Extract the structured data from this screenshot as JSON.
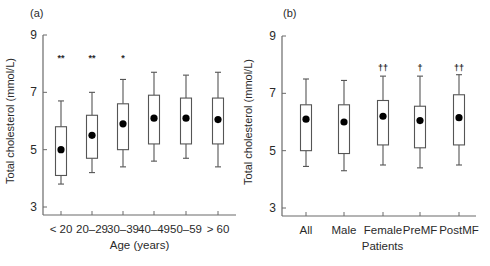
{
  "chart_data": [
    {
      "panel_label": "(a)",
      "type": "box",
      "xlabel": "Age (years)",
      "ylabel": "Total cholesterol (mmol/L)",
      "ylim": [
        3,
        9
      ],
      "yticks": [
        3,
        5,
        7,
        9
      ],
      "grid": false,
      "legend": null,
      "categories": [
        "< 20",
        "20–29",
        "30–39",
        "40–49",
        "50–59",
        "> 60"
      ],
      "whisker_low": [
        3.8,
        4.2,
        4.4,
        4.6,
        4.7,
        4.4
      ],
      "box_low": [
        4.1,
        4.7,
        5.0,
        5.2,
        5.2,
        5.2
      ],
      "box_high": [
        5.8,
        6.2,
        6.6,
        6.9,
        6.8,
        6.8
      ],
      "whisker_high": [
        6.7,
        7.0,
        7.45,
        7.7,
        7.6,
        7.7
      ],
      "mean": [
        5.0,
        5.5,
        5.9,
        6.1,
        6.1,
        6.05
      ],
      "annotations": [
        "**",
        "**",
        "*",
        "",
        "",
        ""
      ],
      "annotation_y": 8.2
    },
    {
      "panel_label": "(b)",
      "type": "box",
      "xlabel": "Patients",
      "ylabel": "Total cholesterol (mmol/L)",
      "ylim": [
        3,
        9
      ],
      "yticks": [
        3,
        5,
        7,
        9
      ],
      "grid": false,
      "legend": null,
      "categories": [
        "All",
        "Male",
        "Female",
        "PreMF",
        "PostMF"
      ],
      "whisker_low": [
        4.45,
        4.3,
        4.5,
        4.4,
        4.5
      ],
      "box_low": [
        5.0,
        4.9,
        5.2,
        5.1,
        5.2
      ],
      "box_high": [
        6.6,
        6.6,
        6.75,
        6.55,
        6.95
      ],
      "whisker_high": [
        7.5,
        7.45,
        7.6,
        7.6,
        7.65
      ],
      "mean": [
        6.1,
        6.0,
        6.2,
        6.05,
        6.15
      ],
      "annotations": [
        "",
        "",
        "††",
        "†",
        "††"
      ],
      "annotation_y": 7.9
    }
  ],
  "layout": {
    "panels": [
      {
        "axis_x": 43,
        "axis_right": 236,
        "y_top_px": 35,
        "y_bottom_px": 207,
        "xaxis_y": 215,
        "cat_x": [
          61,
          92,
          123,
          154,
          186,
          218
        ],
        "box_w": 11,
        "label_x": 30,
        "label_y": 17,
        "ylabel_x": 14,
        "xlabel_y": 249
      },
      {
        "axis_x": 282,
        "axis_right": 476,
        "y_top_px": 36,
        "y_bottom_px": 208,
        "xaxis_y": 216,
        "cat_x": [
          306,
          344,
          383,
          420,
          459
        ],
        "box_w": 11,
        "label_x": 283,
        "label_y": 17,
        "ylabel_x": 252,
        "xlabel_y": 250
      }
    ],
    "colors": {
      "axis": "#6a6a6a",
      "box_stroke": "#555555",
      "box_fill": "#ffffff",
      "mean_dot": "#000000",
      "text": "#2a2a2a"
    }
  }
}
